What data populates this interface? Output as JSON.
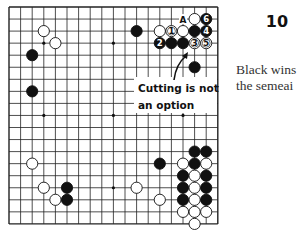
{
  "diagram": {
    "number": "10",
    "caption_lines": [
      "Black wins",
      "the semeai"
    ],
    "board": {
      "size": 19,
      "origin_x": 9,
      "origin_y": 7,
      "spacing_x": 11.6,
      "spacing_y": 12.05,
      "line_color": "#222222",
      "star_points": [
        [
          3,
          3
        ],
        [
          9,
          3
        ],
        [
          3,
          9
        ],
        [
          9,
          9
        ],
        [
          15,
          9
        ],
        [
          9,
          15
        ]
      ],
      "stones": [
        {
          "color": "white",
          "col": 3,
          "row": 2
        },
        {
          "color": "white",
          "col": 4,
          "row": 3
        },
        {
          "color": "black",
          "col": 2,
          "row": 4
        },
        {
          "color": "black",
          "col": 2,
          "row": 7
        },
        {
          "color": "black",
          "col": 11,
          "row": 2
        },
        {
          "color": "white",
          "col": 16,
          "row": 1
        },
        {
          "color": "black",
          "col": 17,
          "row": 1,
          "label": "6"
        },
        {
          "color": "white",
          "col": 13,
          "row": 2
        },
        {
          "color": "white",
          "col": 14,
          "row": 2,
          "label": "1"
        },
        {
          "color": "white",
          "col": 15,
          "row": 2
        },
        {
          "color": "black",
          "col": 16,
          "row": 2
        },
        {
          "color": "black",
          "col": 17,
          "row": 2,
          "label": "4"
        },
        {
          "color": "black",
          "col": 13,
          "row": 3,
          "label": "2"
        },
        {
          "color": "black",
          "col": 14,
          "row": 3
        },
        {
          "color": "black",
          "col": 15,
          "row": 3
        },
        {
          "color": "white",
          "col": 16,
          "row": 3,
          "label": "3"
        },
        {
          "color": "white",
          "col": 17,
          "row": 3,
          "label": "5"
        },
        {
          "color": "black",
          "col": 16,
          "row": 5
        },
        {
          "color": "black",
          "col": 16,
          "row": 12
        },
        {
          "color": "black",
          "col": 17,
          "row": 12
        },
        {
          "color": "black",
          "col": 13,
          "row": 13
        },
        {
          "color": "white",
          "col": 15,
          "row": 13
        },
        {
          "color": "black",
          "col": 16,
          "row": 13
        },
        {
          "color": "white",
          "col": 17,
          "row": 13
        },
        {
          "color": "white",
          "col": 2,
          "row": 13
        },
        {
          "color": "black",
          "col": 15,
          "row": 14
        },
        {
          "color": "white",
          "col": 16,
          "row": 14
        },
        {
          "color": "black",
          "col": 17,
          "row": 14
        },
        {
          "color": "black",
          "col": 15,
          "row": 15
        },
        {
          "color": "white",
          "col": 16,
          "row": 15
        },
        {
          "color": "black",
          "col": 17,
          "row": 15
        },
        {
          "color": "white",
          "col": 11,
          "row": 15
        },
        {
          "color": "white",
          "col": 3,
          "row": 15
        },
        {
          "color": "black",
          "col": 5,
          "row": 15
        },
        {
          "color": "white",
          "col": 4,
          "row": 16
        },
        {
          "color": "black",
          "col": 5,
          "row": 16
        },
        {
          "color": "white",
          "col": 13,
          "row": 16
        },
        {
          "color": "black",
          "col": 15,
          "row": 16
        },
        {
          "color": "white",
          "col": 16,
          "row": 16
        },
        {
          "color": "black",
          "col": 17,
          "row": 16
        },
        {
          "color": "white",
          "col": 15,
          "row": 17
        },
        {
          "color": "white",
          "col": 16,
          "row": 17
        },
        {
          "color": "white",
          "col": 17,
          "row": 17
        },
        {
          "color": "white",
          "col": 16,
          "row": 18
        }
      ],
      "point_labels": [
        {
          "col": 15,
          "row": 1,
          "text": "A"
        }
      ]
    },
    "annotation": {
      "lines": [
        "Cutting is not",
        "an option"
      ],
      "box": {
        "x": 134,
        "y": 77,
        "w": 83,
        "h": 36
      },
      "arrow_from": [
        174,
        80
      ],
      "arrow_to": [
        188,
        52
      ]
    }
  }
}
